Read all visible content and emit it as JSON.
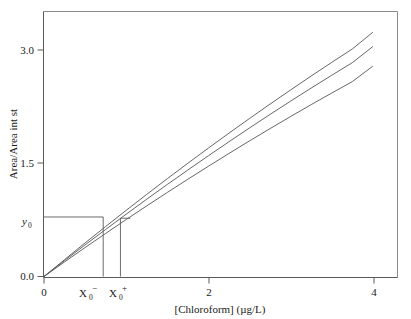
{
  "chart_data": {
    "type": "line",
    "title": "",
    "subtitle": "",
    "xlabel": "[Chloroform] (µg/L)",
    "ylabel": "Area/Area int st",
    "xlim": [
      0,
      4.3
    ],
    "ylim": [
      0,
      3.25
    ],
    "grid": false,
    "legend_position": "none",
    "x_ticks": [
      {
        "value": 0,
        "label": "0"
      },
      {
        "value": 2,
        "label": "2"
      },
      {
        "value": 4,
        "label": "4"
      }
    ],
    "y_ticks": [
      {
        "value": 0.0,
        "label": "0.0"
      },
      {
        "value": 1.5,
        "label": "1.5"
      },
      {
        "value": 3.0,
        "label": "3.0"
      }
    ],
    "special_y_ticks": [
      {
        "value": 0.73,
        "label": "y",
        "subscript": "0"
      }
    ],
    "special_x_ticks": [
      {
        "value": 0.72,
        "label": "X",
        "subscript": "0",
        "superscript": "−"
      },
      {
        "value": 0.93,
        "label": "X",
        "subscript": "0",
        "superscript": "+"
      }
    ],
    "x": [
      0,
      0.25,
      0.5,
      0.75,
      1,
      1.25,
      1.5,
      1.75,
      2,
      2.25,
      2.5,
      2.75,
      3,
      3.25,
      3.5,
      3.75,
      4
    ],
    "series": [
      {
        "name": "upper confidence band",
        "values": [
          0,
          0.207,
          0.412,
          0.613,
          0.812,
          1.007,
          1.2,
          1.389,
          1.575,
          1.758,
          1.938,
          2.115,
          2.288,
          2.459,
          2.626,
          2.79,
          2.995
        ]
      },
      {
        "name": "calibration line",
        "values": [
          0,
          0.195,
          0.388,
          0.577,
          0.764,
          0.948,
          1.129,
          1.306,
          1.481,
          1.653,
          1.822,
          1.988,
          2.151,
          2.311,
          2.468,
          2.622,
          2.82
        ]
      },
      {
        "name": "lower confidence band",
        "values": [
          0,
          0.179,
          0.355,
          0.528,
          0.699,
          0.866,
          1.031,
          1.193,
          1.352,
          1.509,
          1.663,
          1.814,
          1.962,
          2.108,
          2.25,
          2.39,
          2.58
        ]
      }
    ],
    "annotations": [
      {
        "name": "y0-horizontal-line",
        "description": "horizontal construction line from y axis at y0 to upper curve",
        "from": [
          0,
          0.73
        ],
        "to": [
          0.72,
          0.73
        ]
      },
      {
        "name": "x0-minus-vertical-line",
        "description": "vertical construction line from upper curve down to x axis at X0 minus",
        "from": [
          0.72,
          0.73
        ],
        "to": [
          0.72,
          0
        ]
      },
      {
        "name": "y0-horizontal-stub",
        "description": "short horizontal construction stub to the right at y0 level",
        "from": [
          0.93,
          0.715
        ],
        "to": [
          1.05,
          0.715
        ]
      },
      {
        "name": "x0-plus-vertical-line",
        "description": "vertical construction line at X0 plus down to x axis",
        "from": [
          0.93,
          0.715
        ],
        "to": [
          0.93,
          0
        ]
      }
    ]
  },
  "colors": {
    "curve": "#555555",
    "axis": "#5a5a5a",
    "frame": "#8a8a8a",
    "background": "#ffffff",
    "text": "#1a1a1a"
  }
}
